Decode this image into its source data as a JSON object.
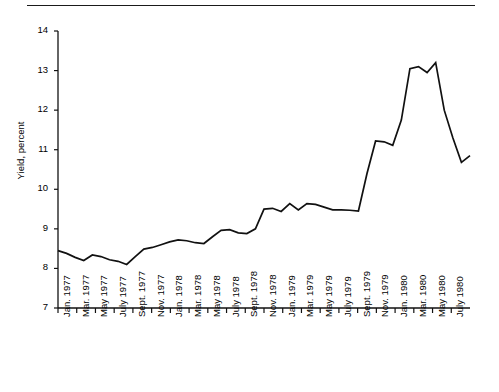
{
  "figure": {
    "has_top_rule": true,
    "background_color": "#ffffff",
    "line_color": "#111111"
  },
  "chart_data": {
    "type": "line",
    "title": "",
    "subtitle": "",
    "xlabel": "",
    "ylabel": "Yield, percent",
    "ylim": [
      7,
      14
    ],
    "yticks": [
      7,
      8,
      9,
      10,
      11,
      12,
      13,
      14
    ],
    "ytick_labels": [
      "7",
      "8",
      "9",
      "10",
      "11",
      "12",
      "13",
      "14"
    ],
    "grid": false,
    "legend": null,
    "xtick_labels": [
      "Jan. 1977",
      "Mar. 1977",
      "May 1977",
      "July 1977",
      "Sept. 1977",
      "Nov. 1977",
      "Jan. 1978",
      "Mar. 1978",
      "May 1978",
      "July 1978",
      "Sept. 1978",
      "Nov. 1978",
      "Jan. 1979",
      "Mar. 1979",
      "May 1979",
      "July 1979",
      "Sept. 1979",
      "Nov. 1979",
      "Jan. 1980",
      "Mar. 1980",
      "May 1980",
      "July 1980"
    ],
    "x": [
      "Jan. 1977",
      "Feb. 1977",
      "Mar. 1977",
      "Apr. 1977",
      "May 1977",
      "June 1977",
      "July 1977",
      "Aug. 1977",
      "Sept. 1977",
      "Oct. 1977",
      "Nov. 1977",
      "Dec. 1977",
      "Jan. 1978",
      "Feb. 1978",
      "Mar. 1978",
      "Apr. 1978",
      "May 1978",
      "June 1978",
      "July 1978",
      "Aug. 1978",
      "Sept. 1978",
      "Oct. 1978",
      "Nov. 1978",
      "Dec. 1978",
      "Jan. 1979",
      "Feb. 1979",
      "Mar. 1979",
      "Apr. 1979",
      "May 1979",
      "June 1979",
      "July 1979",
      "Aug. 1979",
      "Sept. 1979",
      "Oct. 1979",
      "Nov. 1979",
      "Dec. 1979",
      "Jan. 1980",
      "Feb. 1980",
      "Mar. 1980",
      "Apr. 1980",
      "May 1980",
      "June 1980",
      "July 1980"
    ],
    "values": [
      8.45,
      8.38,
      8.28,
      8.2,
      8.34,
      8.3,
      8.22,
      8.18,
      8.1,
      8.3,
      8.49,
      8.53,
      8.6,
      8.67,
      8.72,
      8.7,
      8.65,
      8.63,
      8.8,
      8.96,
      8.98,
      8.9,
      8.88,
      9.0,
      9.5,
      9.52,
      9.44,
      9.64,
      9.48,
      9.64,
      9.62,
      9.55,
      9.48,
      9.48,
      9.47,
      9.45,
      10.4,
      11.22,
      11.2,
      11.11,
      11.75,
      13.05,
      13.1
    ],
    "series": [
      {
        "name": "Yield",
        "values": [
          8.45,
          8.38,
          8.28,
          8.2,
          8.34,
          8.3,
          8.22,
          8.18,
          8.1,
          8.3,
          8.49,
          8.53,
          8.6,
          8.67,
          8.72,
          8.7,
          8.65,
          8.63,
          8.8,
          8.96,
          8.98,
          8.9,
          8.88,
          9.0,
          9.5,
          9.52,
          9.44,
          9.64,
          9.48,
          9.64,
          9.62,
          9.55,
          9.48,
          9.48,
          9.47,
          9.45,
          10.4,
          11.22,
          11.2,
          11.11,
          11.75,
          13.05,
          13.1
        ]
      }
    ]
  },
  "plot_geometry": {
    "pixel_values": [
      8.45,
      8.38,
      8.28,
      8.2,
      8.34,
      8.3,
      8.22,
      8.18,
      8.1,
      8.3,
      8.49,
      8.53,
      8.6,
      8.67,
      8.72,
      8.7,
      8.65,
      8.63,
      8.8,
      8.96,
      8.98,
      8.9,
      8.88,
      9.0,
      9.5,
      9.52,
      9.44,
      9.64,
      9.48,
      9.64,
      9.62,
      9.55,
      9.48,
      9.48,
      9.47,
      9.45,
      10.4,
      11.22,
      11.2,
      11.11,
      11.75,
      13.05,
      13.1,
      12.95,
      13.2,
      12.0,
      11.3,
      10.68,
      10.85
    ]
  }
}
